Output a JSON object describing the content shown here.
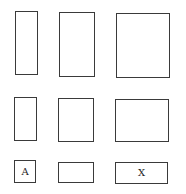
{
  "diagram": {
    "stroke_color": "#3a3a3a",
    "background": "#ffffff",
    "rows": [
      {
        "shapes": [
          {
            "id": "r1c1",
            "label": "",
            "x": 15,
            "y": 11,
            "w": 23,
            "h": 64
          },
          {
            "id": "r1c2",
            "label": "",
            "x": 59,
            "y": 12,
            "w": 36,
            "h": 65
          },
          {
            "id": "r1c3",
            "label": "",
            "x": 116,
            "y": 13,
            "w": 54,
            "h": 65
          }
        ]
      },
      {
        "shapes": [
          {
            "id": "r2c1",
            "label": "",
            "x": 14,
            "y": 97,
            "w": 23,
            "h": 44
          },
          {
            "id": "r2c2",
            "label": "",
            "x": 58,
            "y": 98,
            "w": 36,
            "h": 44
          },
          {
            "id": "r2c3",
            "label": "",
            "x": 115,
            "y": 99,
            "w": 54,
            "h": 43
          }
        ]
      },
      {
        "shapes": [
          {
            "id": "r3c1",
            "label": "A",
            "x": 14,
            "y": 160,
            "w": 22,
            "h": 23
          },
          {
            "id": "r3c2",
            "label": "",
            "x": 58,
            "y": 162,
            "w": 36,
            "h": 21
          },
          {
            "id": "r3c3",
            "label": "X",
            "x": 115,
            "y": 162,
            "w": 53,
            "h": 22
          }
        ]
      }
    ]
  }
}
